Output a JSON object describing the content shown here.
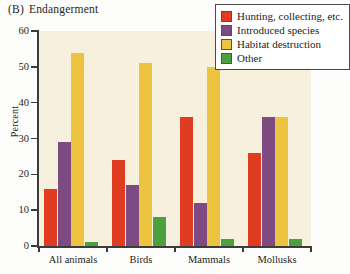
{
  "title": {
    "label": "(B)",
    "text": "Endangerment"
  },
  "legend": {
    "position": "top-right",
    "items": [
      {
        "label": "Hunting, collecting, etc.",
        "color": "#e03c22"
      },
      {
        "label": "Introduced species",
        "color": "#7d4a82"
      },
      {
        "label": "Habitat destruction",
        "color": "#edc43f"
      },
      {
        "label": "Other",
        "color": "#4da040"
      }
    ]
  },
  "chart_data": {
    "type": "bar",
    "xlabel": "",
    "ylabel": "Percent",
    "ylim": [
      0,
      60
    ],
    "yticks": [
      0,
      10,
      20,
      30,
      40,
      50,
      60
    ],
    "grid": false,
    "categories": [
      "All animals",
      "Birds",
      "Mammals",
      "Mollusks"
    ],
    "series": [
      {
        "name": "Hunting, collecting, etc.",
        "color": "#e03c22",
        "values": [
          16,
          24,
          36,
          26
        ]
      },
      {
        "name": "Introduced species",
        "color": "#7d4a82",
        "values": [
          29,
          17,
          12,
          36
        ]
      },
      {
        "name": "Habitat destruction",
        "color": "#edc43f",
        "values": [
          54,
          51,
          50,
          36
        ]
      },
      {
        "name": "Other",
        "color": "#4da040",
        "values": [
          1,
          8,
          2,
          2
        ]
      }
    ]
  },
  "style": {
    "plot_background": "#f7f0dc",
    "axis_color": "#3b3b3b",
    "page_background": "#fdfdfb"
  }
}
